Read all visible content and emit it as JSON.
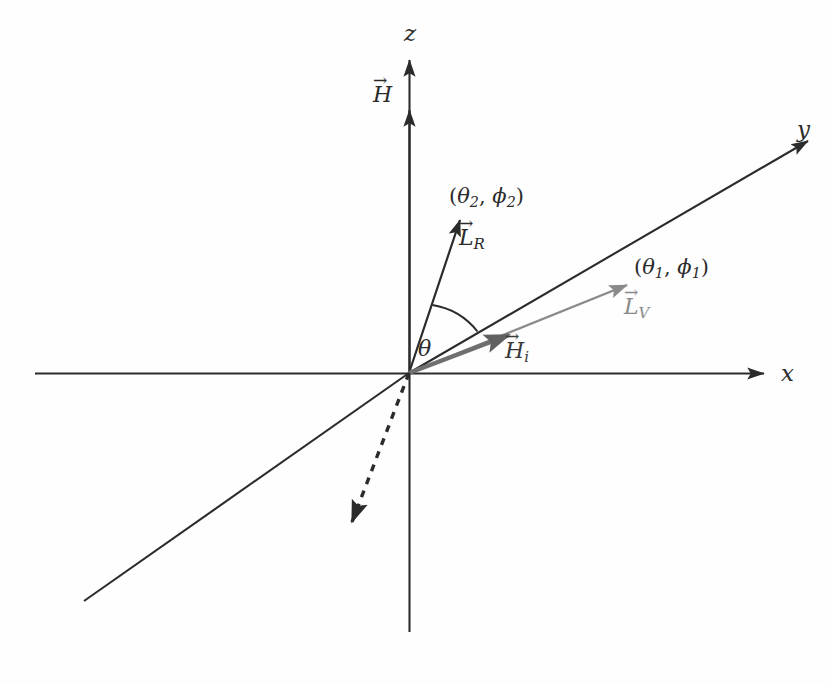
{
  "figure": {
    "background_color": "#fefefe",
    "line_color": "#2b2b2b",
    "gray_color": "#8a8a8a",
    "dark_gray_color": "#777777"
  },
  "axes": [
    {
      "name": "z-axis",
      "label": "z",
      "direction": "up",
      "label_x": 404,
      "label_y": 22
    },
    {
      "name": "y-axis",
      "label": "y",
      "direction": "upper-right-diagonal",
      "label_x": 797,
      "label_y": 118
    },
    {
      "name": "x-axis",
      "label": "x",
      "direction": "right",
      "label_x": 781,
      "label_y": 362
    }
  ],
  "vectors": [
    {
      "name": "H-field",
      "label": "H",
      "arrow_accent": "→",
      "subscript": "",
      "color": "#2b2b2b",
      "label_x": 373,
      "label_y": 84,
      "style": "solid"
    },
    {
      "name": "L-R",
      "label": "L",
      "arrow_accent": "→",
      "subscript": "R",
      "color": "#2b2b2b",
      "label_x": 459,
      "label_y": 227,
      "style": "solid"
    },
    {
      "name": "L-V",
      "label": "L",
      "arrow_accent": "→",
      "subscript": "V",
      "color": "#8a8a8a",
      "label_x": 624,
      "label_y": 296,
      "style": "solid-gray"
    },
    {
      "name": "H-i",
      "label": "H",
      "arrow_accent": "→",
      "subscript": "i",
      "color": "#555555",
      "label_x": 505,
      "label_y": 340,
      "style": "thick-gray"
    }
  ],
  "annotations": [
    {
      "name": "coords-theta2-phi2",
      "text_open": "(",
      "theta": "θ",
      "theta_sub": "2",
      "comma": ", ",
      "phi": "ϕ",
      "phi_sub": "2",
      "text_close": ")",
      "x": 449,
      "y": 186
    },
    {
      "name": "coords-theta1-phi1",
      "text_open": "(",
      "theta": "θ",
      "theta_sub": "1",
      "comma": ", ",
      "phi": "ϕ",
      "phi_sub": "1",
      "text_close": ")",
      "x": 634,
      "y": 257
    }
  ],
  "angle": {
    "name": "theta-angle",
    "label": "θ",
    "label_x": 418,
    "label_y": 338,
    "description": "angle arc between L_R vector and y-axis"
  },
  "geometry": {
    "origin": {
      "x": 409,
      "y": 373
    },
    "z_axis": {
      "x1": 409,
      "y1": 632,
      "x2": 409,
      "y2": 52
    },
    "x_axis": {
      "x1": 35,
      "y1": 373,
      "x2": 772,
      "y2": 373
    },
    "y_axis_pos": {
      "x1": 409,
      "y1": 373,
      "x2": 816,
      "y2": 136
    },
    "y_axis_neg": {
      "x1": 409,
      "y1": 373,
      "x2": 84,
      "y2": 601
    },
    "h_vector": {
      "x1": 409,
      "y1": 373,
      "x2": 409,
      "y2": 103
    },
    "lr_vector": {
      "x1": 409,
      "y1": 373,
      "x2": 462,
      "y2": 214
    },
    "lv_vector": {
      "x1": 409,
      "y1": 373,
      "x2": 634,
      "y2": 282
    },
    "hi_vector": {
      "x1": 409,
      "y1": 373,
      "x2": 517,
      "y2": 331
    },
    "dashed_vector": {
      "x1": 409,
      "y1": 373,
      "x2": 348,
      "y2": 531
    },
    "theta_arc": {
      "radius": 72
    }
  }
}
